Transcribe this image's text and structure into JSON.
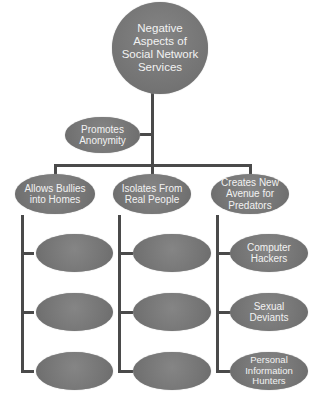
{
  "diagram": {
    "root": {
      "label": "Negative Aspects of Social Network Services"
    },
    "side_node": {
      "label": "Promotes Anonymity"
    },
    "branches": [
      {
        "label": "Allows Bullies into Homes",
        "children": [
          "",
          "",
          ""
        ]
      },
      {
        "label": "Isolates From Real People",
        "children": [
          "",
          "",
          ""
        ]
      },
      {
        "label": "Creates New Avenue for Predators",
        "children": [
          "Computer Hackers",
          "Sexual Deviants",
          "Personal Information Hunters"
        ]
      }
    ]
  },
  "colors": {
    "node_fill": "#7a7a7a",
    "node_text": "#f2f2f2",
    "connector": "#4a4a4a",
    "background": "#ffffff"
  }
}
